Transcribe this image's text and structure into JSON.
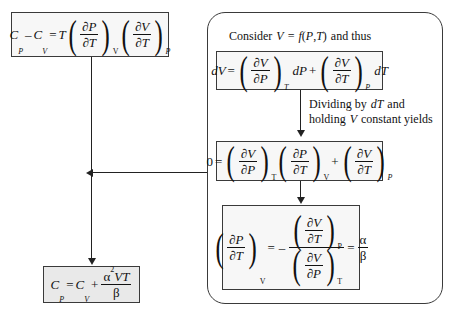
{
  "diagram": {
    "colors": {
      "line": "#222222",
      "box_border": "#3a3a3a",
      "box_fill": "#f7f7f7",
      "shaded_fill": "#e9e9e9",
      "background": "#ffffff"
    }
  },
  "equation_top_left": {
    "name": "Cp minus Cv relation",
    "plain": "C_P - C_V = T (dP/dT)_V (dV/dT)_P",
    "lhs_c": "C",
    "sub_p": "P",
    "minus": "–",
    "sub_v": "V",
    "equals": "=",
    "t": "T",
    "partial": "∂",
    "num_p": "P",
    "den_t": "T",
    "num_v": "V",
    "paren_sub_v": "V",
    "paren_sub_p": "P"
  },
  "equation_bottom_left": {
    "name": "Cp final result",
    "plain": "C_P = C_V + alpha^2 V T / beta",
    "c": "C",
    "sub_p": "P",
    "equals": "=",
    "sub_v": "V",
    "plus": "+",
    "alpha": "α",
    "exponent": "2",
    "numerator_vars": "VT",
    "beta": "β"
  },
  "panel": {
    "intro_text": "Consider V = f(P,T) and thus",
    "intro_parts": {
      "consider": "Consider",
      "v": "V",
      "equals": "=",
      "f": "f",
      "open": "(",
      "p": "P",
      "comma": ",",
      "t": "T",
      "close": ")",
      "and_thus": "and thus"
    },
    "middle_text_line1": "Dividing by dT and",
    "middle_text_line2": "holding V constant yields",
    "middle_parts": {
      "dividing_by": "Dividing by",
      "dT": "dT",
      "and": "and",
      "holding": "holding",
      "v": "V",
      "constant_yields": "constant yields"
    },
    "equation_dv": {
      "name": "total differential of V",
      "plain": "dV = (dV/dP)_T dP + (dV/dT)_P dT",
      "d": "d",
      "v": "V",
      "equals": "=",
      "partial": "∂",
      "num_v": "V",
      "den_p": "P",
      "sub_t": "T",
      "dP": "dP",
      "plus": "+",
      "den_t": "T",
      "sub_p": "P",
      "dT": "dT"
    },
    "equation_zero": {
      "name": "cyclic rule expression",
      "plain": "0 = (dV/dP)_T (dP/dT)_V + (dV/dT)_P",
      "zero": "0",
      "equals": "=",
      "partial": "∂",
      "num_v": "V",
      "den_p": "P",
      "sub_t": "T",
      "num_p": "P",
      "den_t": "T",
      "sub_v": "V",
      "plus": "+",
      "sub_p": "P"
    },
    "equation_ratio": {
      "name": "pressure temperature derivative as alpha over beta",
      "plain": "(dP/dT)_V = - (dV/dT)_P / (dV/dP)_T = alpha/beta",
      "partial": "∂",
      "num_p": "P",
      "den_t": "T",
      "sub_v": "V",
      "equals": "=",
      "minus": "–",
      "num_v": "V",
      "sub_p": "P",
      "den_p": "P",
      "sub_t": "T",
      "alpha": "α",
      "beta": "β"
    }
  }
}
